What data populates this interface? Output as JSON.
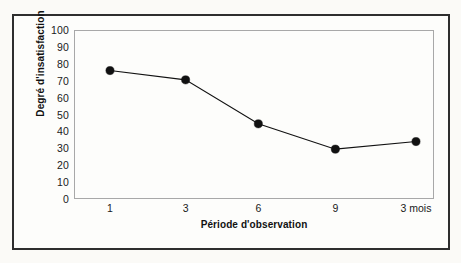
{
  "chart_data": {
    "type": "line",
    "title": "",
    "xlabel": "Période d'observation",
    "ylabel": "Degré d'insatisfaction",
    "categories": [
      "1",
      "3",
      "6",
      "9",
      "3 mois"
    ],
    "values": [
      76,
      70.5,
      44.5,
      29.5,
      34
    ],
    "ylim": [
      0,
      100
    ],
    "ytick_step": 10,
    "yticks": [
      "100",
      "90",
      "80",
      "70",
      "60",
      "50",
      "40",
      "30",
      "20",
      "10",
      "0"
    ],
    "grid": false,
    "legend": "none",
    "marker": "filled-circle",
    "line_color": "#111111",
    "marker_color": "#111111",
    "plot_border_color": "#a8a8a8",
    "frame_color": "#2e2e2e",
    "background_color": "#fdfdfb"
  }
}
